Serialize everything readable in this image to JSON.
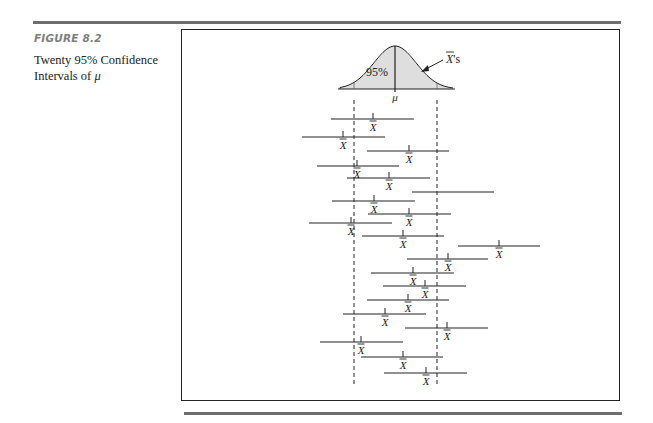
{
  "figure": {
    "label": "FIGURE 8.2",
    "caption_line1": "Twenty 95% Confidence",
    "caption_line2_prefix": "Intervals of ",
    "caption_symbol": "μ"
  },
  "chart_data": {
    "type": "interval",
    "title": "Twenty 95% Confidence Intervals of μ",
    "curve": {
      "label_center": "95%",
      "label_mean": "μ",
      "arrow_label": "X̄'s",
      "baseline_y": 89,
      "x_start": 340,
      "x_end": 453,
      "peak_x": 395,
      "peak_y": 46,
      "lower_cut_x": 354,
      "upper_cut_x": 437
    },
    "reference_lines": {
      "lower_x": 354,
      "upper_x": 437,
      "y_top": 100,
      "y_bottom": 385,
      "style": "dashed"
    },
    "mean_label": "X̄",
    "intervals": [
      {
        "y": 119,
        "lo": 331,
        "hi": 414,
        "mean": 373,
        "label": true
      },
      {
        "y": 137,
        "lo": 302,
        "hi": 385,
        "mean": 343,
        "label": true
      },
      {
        "y": 151,
        "lo": 367,
        "hi": 449,
        "mean": 409,
        "label": true
      },
      {
        "y": 166,
        "lo": 317,
        "hi": 399,
        "mean": 357,
        "label": true
      },
      {
        "y": 178,
        "lo": 347,
        "hi": 430,
        "mean": 389,
        "label": true
      },
      {
        "y": 192,
        "lo": 412,
        "hi": 494,
        "mean": null,
        "label": false
      },
      {
        "y": 201,
        "lo": 332,
        "hi": 415,
        "mean": 374,
        "label": true
      },
      {
        "y": 214,
        "lo": 368,
        "hi": 451,
        "mean": 409,
        "label": true
      },
      {
        "y": 223,
        "lo": 309,
        "hi": 392,
        "mean": 351,
        "label": true
      },
      {
        "y": 236,
        "lo": 362,
        "hi": 444,
        "mean": 403,
        "label": true
      },
      {
        "y": 246,
        "lo": 458,
        "hi": 540,
        "mean": 499,
        "label": true
      },
      {
        "y": 259,
        "lo": 407,
        "hi": 488,
        "mean": 448,
        "label": true
      },
      {
        "y": 273,
        "lo": 371,
        "hi": 454,
        "mean": 413,
        "label": true
      },
      {
        "y": 286,
        "lo": 383,
        "hi": 466,
        "mean": 425,
        "label": true
      },
      {
        "y": 300,
        "lo": 367,
        "hi": 449,
        "mean": 408,
        "label": true
      },
      {
        "y": 314,
        "lo": 343,
        "hi": 426,
        "mean": 385,
        "label": true
      },
      {
        "y": 328,
        "lo": 405,
        "hi": 488,
        "mean": 447,
        "label": true
      },
      {
        "y": 342,
        "lo": 320,
        "hi": 403,
        "mean": 361,
        "label": true
      },
      {
        "y": 357,
        "lo": 361,
        "hi": 443,
        "mean": 403,
        "label": true
      },
      {
        "y": 373,
        "lo": 384,
        "hi": 467,
        "mean": 426,
        "label": true
      }
    ],
    "count": 20,
    "confidence": "95%",
    "grid": false,
    "legend": null
  }
}
